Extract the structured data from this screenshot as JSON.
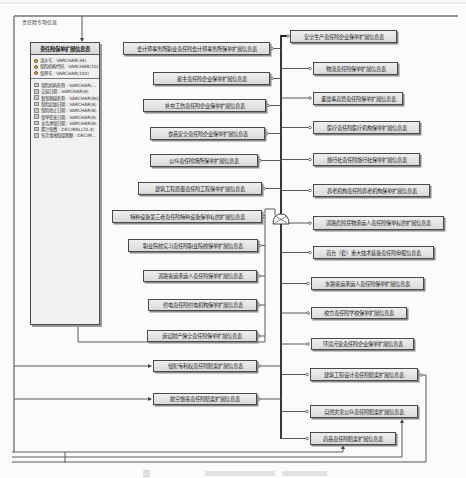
{
  "diagram": {
    "package_label": "责任险专项信息",
    "main_entity": {
      "title": "责任险保单扩展信息表",
      "primary_keys": [
        "流水号 : VARCHAR(34)",
        "保险机构代码 : VARCHAR(10)",
        "保单号 : VARCHAR(100)"
      ],
      "attributes": [
        "保险机构名称 : VARCHAR(...",
        "交易日期 : VARCHAR(8)",
        "套保基础名称 : VARCHAR(80)",
        "保险起始日期 : VARCHAR(8)",
        "保险终止日期 : VARCHAR(8)",
        "保单签发日期 : VARCHAR(8)",
        "业务承保日期 : VARCHAR(8)",
        "累计保费 : DECIMAL(20,4)",
        "每次事故赔偿限额 : DECIM..."
      ]
    },
    "left_entities": [
      "会计师事务所职业责任险会计师事务所保单扩展信息表",
      "雇主责任险企业保单扩展信息表",
      "补充工伤责任险企业保单扩展信息表",
      "食品安全责任险企业保单扩展信息表",
      "公众责任险场所保单扩展信息表",
      "建筑工程质量责任险工程保单扩展信息表",
      "特种设备第三者责任险特种设备保单标的扩展信息表",
      "职业院校实习责任险职业院校保单扩展信息表",
      "道路客运承运人责任险保单扩展信息表",
      "供电责任险供电机构保单扩展信息表",
      "诉讼财产保全责任险保单扩展信息表",
      "侵犯专利权责任险赔案扩展信息表",
      "航空旅客责任险赔案扩展信息表"
    ],
    "right_entities": [
      "安全生产责任险企业保单扩展信息表",
      "物流责任险保单扩展信息表",
      "董监事高管责任险保单扩展信息表",
      "医疗责任险医疗机构保单扩展信息表",
      "旅行社责任险旅行社保单扩展信息表",
      "养老机构责任险养老机构保单扩展信息表",
      "道路危险货物承运人责任险保单标的扩展信息表",
      "首台（套）重大技术装备责任险申报信息表",
      "水路客运承运人责任险保单扩展信息表",
      "校方责任险学校保单扩展信息表",
      "环境污染责任险企业保单扩展信息表",
      "建筑工程设计责任险赔案扩展信息表",
      "自然灾害公众责任险赔案扩展信息表",
      "药品责任险赔案扩展信息表"
    ],
    "caption": "图"
  }
}
